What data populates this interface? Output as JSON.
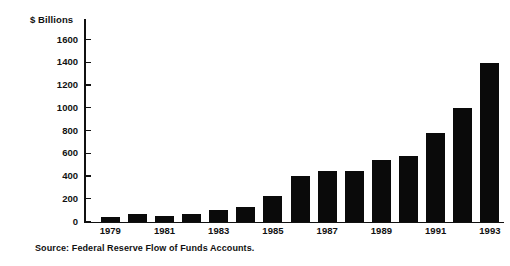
{
  "chart_data": {
    "type": "bar",
    "title": "",
    "subtitle": "",
    "xlabel": "",
    "ylabel": "$ Billions",
    "ylim": [
      0,
      1700
    ],
    "yticks": [
      0,
      200,
      400,
      600,
      800,
      1000,
      1200,
      1400,
      1600
    ],
    "ytick_labels": [
      "0",
      "200",
      "400",
      "600",
      "800",
      "1000",
      "1200",
      "1400",
      "1600"
    ],
    "grid": false,
    "legend": null,
    "bar_color": "#0a0a0a",
    "categories": [
      "1979",
      "1980",
      "1981",
      "1982",
      "1983",
      "1984",
      "1985",
      "1986",
      "1987",
      "1988",
      "1989",
      "1990",
      "1991",
      "1992",
      "1993"
    ],
    "xtick_labels": [
      "1979",
      "1981",
      "1983",
      "1985",
      "1987",
      "1989",
      "1991",
      "1993"
    ],
    "values": [
      45,
      70,
      55,
      72,
      105,
      135,
      230,
      405,
      450,
      445,
      545,
      580,
      780,
      1005,
      1395
    ],
    "annotation": "Source:  Federal Reserve Flow of Funds Accounts."
  },
  "figure": {
    "y_axis_title": "$ Billions",
    "source_note": "Source:  Federal Reserve Flow of Funds Accounts."
  }
}
